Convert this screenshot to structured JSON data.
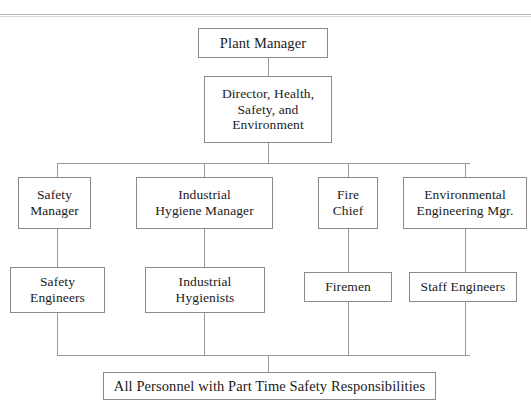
{
  "document": {
    "type": "organization-chart",
    "title": "Safety Organization Chart",
    "page_rule_present": true
  },
  "nodes": {
    "plant_manager": {
      "label": "Plant Manager",
      "x": 198,
      "y": 28,
      "w": 130,
      "h": 30,
      "font": 14.5
    },
    "director_hse": {
      "label": "Director, Health,\nSafety, and\nEnvironment",
      "x": 204,
      "y": 76,
      "w": 128,
      "h": 67,
      "font": 13.5
    },
    "safety_manager": {
      "label": "Safety\nManager",
      "x": 18,
      "y": 177,
      "w": 73,
      "h": 52,
      "font": 13.5
    },
    "industrial_hygiene_manager": {
      "label": "Industrial\nHygiene Manager",
      "x": 136,
      "y": 177,
      "w": 137,
      "h": 52,
      "font": 13.5
    },
    "fire_chief": {
      "label": "Fire\nChief",
      "x": 318,
      "y": 177,
      "w": 60,
      "h": 52,
      "font": 13.5
    },
    "environmental_engineering_mgr": {
      "label": "Environmental\nEngineering Mgr.",
      "x": 403,
      "y": 177,
      "w": 124,
      "h": 52,
      "font": 13.5
    },
    "safety_engineers": {
      "label": "Safety\nEngineers",
      "x": 10,
      "y": 267,
      "w": 95,
      "h": 46,
      "font": 13.5
    },
    "industrial_hygienists": {
      "label": "Industrial\nHygienists",
      "x": 145,
      "y": 267,
      "w": 120,
      "h": 46,
      "font": 13.5
    },
    "firemen": {
      "label": "Firemen",
      "x": 304,
      "y": 272,
      "w": 88,
      "h": 30,
      "font": 13.5
    },
    "staff_engineers": {
      "label": "Staff Engineers",
      "x": 409,
      "y": 272,
      "w": 108,
      "h": 30,
      "font": 13.5
    },
    "all_personnel": {
      "label": "All Personnel with Part Time Safety Responsibilities",
      "x": 103,
      "y": 372,
      "w": 333,
      "h": 28,
      "font": 14.5
    }
  },
  "connectors": {
    "page_rule_y": 14,
    "upper_bus": {
      "y": 163,
      "x1": 57,
      "x2": 470
    },
    "lower_bus": {
      "y": 355,
      "x1": 57,
      "x2": 470
    },
    "director_stem_x": 268,
    "bottom_stem_x": 268,
    "column_x": [
      57,
      204,
      348,
      465
    ]
  },
  "colors": {
    "box_border": "#8a8a8a",
    "connector": "#9a9a9a",
    "text": "#1b1b1b",
    "page_rule": "#b9b9b9",
    "background": "#ffffff"
  }
}
